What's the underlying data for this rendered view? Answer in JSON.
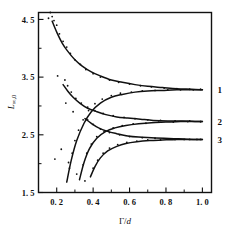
{
  "chart_data": {
    "type": "line",
    "title": "",
    "xlabel": "Γ/d",
    "ylabel": "L∞,0",
    "xlim": [
      0.1,
      1.05
    ],
    "ylim": [
      1.5,
      4.62
    ],
    "grid": false,
    "legend_position": "right-outside",
    "xticks": [
      0.2,
      0.4,
      0.6,
      0.8,
      1.0
    ],
    "xtick_labels": [
      "0. 2",
      "0. 4",
      "0. 6",
      "0. 8",
      "1. 0"
    ],
    "yticks": [
      1.5,
      2.5,
      3.5,
      4.5
    ],
    "ytick_labels": [
      "1. 5",
      "2. 5",
      "3. 5",
      "4. 5"
    ],
    "xminor": [
      0.1,
      0.3,
      0.5,
      0.7,
      0.9
    ],
    "yminor": [
      2.0,
      3.0,
      4.0
    ],
    "series": [
      {
        "name": "1",
        "label": "1",
        "annotation": "1",
        "asymptote": 3.28,
        "branch_upper": {
          "x": [
            0.175,
            0.2,
            0.23,
            0.26,
            0.3,
            0.34,
            0.39,
            0.44,
            0.5,
            0.56,
            0.63,
            0.7,
            0.78,
            0.86,
            0.94,
            1.0
          ],
          "y": [
            4.47,
            4.28,
            4.09,
            3.95,
            3.8,
            3.69,
            3.59,
            3.52,
            3.45,
            3.41,
            3.37,
            3.34,
            3.32,
            3.3,
            3.29,
            3.28
          ]
        },
        "branch_lower": {
          "x": [
            0.255,
            0.28,
            0.31,
            0.35,
            0.39,
            0.44,
            0.5,
            0.56,
            0.63,
            0.7,
            0.78,
            0.86,
            0.94,
            1.0
          ],
          "y": [
            1.68,
            2.06,
            2.4,
            2.7,
            2.9,
            3.05,
            3.15,
            3.2,
            3.24,
            3.26,
            3.27,
            3.28,
            3.28,
            3.28
          ]
        },
        "points_upper": {
          "x": [
            0.165,
            0.175,
            0.185,
            0.2,
            0.215,
            0.235,
            0.255,
            0.275,
            0.3,
            0.33,
            0.36,
            0.4,
            0.44,
            0.49,
            0.54,
            0.6,
            0.66,
            0.72,
            0.79,
            0.86,
            0.93,
            0.99
          ],
          "y": [
            4.62,
            4.55,
            4.48,
            4.4,
            4.25,
            4.12,
            4.02,
            3.91,
            3.8,
            3.72,
            3.63,
            3.56,
            3.5,
            3.45,
            3.41,
            3.38,
            3.35,
            3.33,
            3.31,
            3.3,
            3.29,
            3.29
          ]
        },
        "points_lower": {
          "x": [
            0.27,
            0.285,
            0.3,
            0.32,
            0.345,
            0.375,
            0.41,
            0.45,
            0.5,
            0.55,
            0.61,
            0.67,
            0.74,
            0.81,
            0.88,
            0.95
          ],
          "y": [
            1.92,
            2.18,
            2.4,
            2.58,
            2.76,
            2.92,
            3.04,
            3.12,
            3.18,
            3.22,
            3.24,
            3.26,
            3.27,
            3.28,
            3.28,
            3.28
          ]
        }
      },
      {
        "name": "2",
        "label": "2",
        "annotation": "2",
        "asymptote": 2.73,
        "branch_upper": {
          "x": [
            0.235,
            0.26,
            0.29,
            0.33,
            0.37,
            0.42,
            0.47,
            0.53,
            0.59,
            0.66,
            0.73,
            0.81,
            0.89,
            0.97,
            1.0
          ],
          "y": [
            3.37,
            3.26,
            3.15,
            3.04,
            2.96,
            2.9,
            2.85,
            2.81,
            2.79,
            2.77,
            2.75,
            2.74,
            2.74,
            2.73,
            2.73
          ]
        },
        "branch_lower": {
          "x": [
            0.325,
            0.35,
            0.38,
            0.42,
            0.47,
            0.52,
            0.58,
            0.65,
            0.72,
            0.8,
            0.88,
            0.96,
            1.0
          ],
          "y": [
            1.72,
            2.02,
            2.26,
            2.44,
            2.56,
            2.62,
            2.66,
            2.69,
            2.71,
            2.72,
            2.73,
            2.73,
            2.73
          ]
        },
        "points_upper": {
          "x": [
            0.245,
            0.26,
            0.28,
            0.305,
            0.335,
            0.37,
            0.41,
            0.455,
            0.51,
            0.57,
            0.63,
            0.7,
            0.77,
            0.85,
            0.93,
            0.99
          ],
          "y": [
            3.45,
            3.35,
            3.24,
            3.13,
            3.05,
            2.98,
            2.92,
            2.87,
            2.83,
            2.8,
            2.78,
            2.76,
            2.75,
            2.74,
            2.74,
            2.73
          ]
        },
        "points_lower": {
          "x": [
            0.345,
            0.365,
            0.39,
            0.42,
            0.46,
            0.51,
            0.56,
            0.62,
            0.69,
            0.76,
            0.84,
            0.92,
            0.99
          ],
          "y": [
            1.98,
            2.18,
            2.34,
            2.47,
            2.56,
            2.62,
            2.66,
            2.69,
            2.7,
            2.72,
            2.72,
            2.73,
            2.73
          ]
        }
      },
      {
        "name": "3",
        "label": "3",
        "annotation": "3",
        "asymptote": 2.42,
        "branch_upper": {
          "x": [
            0.355,
            0.39,
            0.43,
            0.48,
            0.53,
            0.59,
            0.65,
            0.72,
            0.79,
            0.87,
            0.95,
            1.0
          ],
          "y": [
            2.78,
            2.7,
            2.62,
            2.56,
            2.52,
            2.48,
            2.46,
            2.45,
            2.44,
            2.43,
            2.42,
            2.42
          ]
        },
        "branch_lower": {
          "x": [
            0.385,
            0.41,
            0.44,
            0.48,
            0.53,
            0.58,
            0.64,
            0.71,
            0.78,
            0.86,
            0.94,
            1.0
          ],
          "y": [
            1.77,
            1.95,
            2.1,
            2.22,
            2.3,
            2.35,
            2.38,
            2.4,
            2.41,
            2.42,
            2.42,
            2.42
          ]
        },
        "points_upper": {
          "x": [
            0.37,
            0.4,
            0.44,
            0.49,
            0.545,
            0.6,
            0.67,
            0.74,
            0.82,
            0.9,
            0.97
          ],
          "y": [
            2.76,
            2.68,
            2.6,
            2.54,
            2.5,
            2.47,
            2.45,
            2.44,
            2.43,
            2.42,
            2.42
          ]
        },
        "points_lower": {
          "x": [
            0.4,
            0.425,
            0.455,
            0.49,
            0.535,
            0.585,
            0.64,
            0.7,
            0.77,
            0.85,
            0.93,
            0.99
          ],
          "y": [
            1.92,
            2.06,
            2.18,
            2.27,
            2.33,
            2.37,
            2.39,
            2.41,
            2.41,
            2.42,
            2.42,
            2.42
          ]
        }
      }
    ],
    "stray_points": {
      "x": [
        0.155,
        0.205,
        0.25,
        0.29,
        0.19,
        0.225,
        0.265,
        0.31,
        0.355
      ],
      "y": [
        4.52,
        3.52,
        3.05,
        2.9,
        2.08,
        2.25,
        2.02,
        1.82,
        1.7
      ]
    }
  },
  "colors": {
    "ink": "#111111",
    "background": "#ffffff"
  }
}
